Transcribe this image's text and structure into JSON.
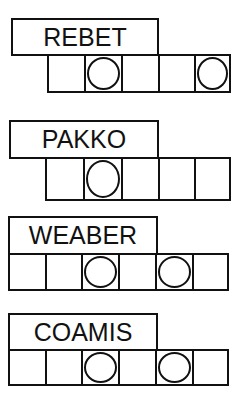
{
  "puzzles": [
    {
      "scrambled": "REBET",
      "cells": 5,
      "circled": [
        1,
        4
      ]
    },
    {
      "scrambled": "PAKKO",
      "cells": 5,
      "circled": [
        1
      ]
    },
    {
      "scrambled": "WEABER",
      "cells": 6,
      "circled": [
        2,
        4
      ]
    },
    {
      "scrambled": "COAMIS",
      "cells": 6,
      "circled": [
        2,
        4
      ]
    }
  ],
  "colors": {
    "ink": "#111111",
    "background": "#ffffff"
  }
}
